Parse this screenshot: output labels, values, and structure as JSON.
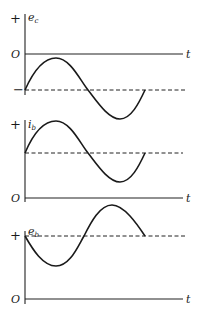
{
  "figure": {
    "colors": {
      "ink": "#1a1a1a",
      "background": "#ffffff"
    },
    "panels": [
      {
        "id": "ec",
        "y_label": "e",
        "y_label_sub": "c",
        "plus_label": "+",
        "origin_label": "O",
        "minus_label": "−",
        "t_label": "t",
        "dashed_reference": "negative DC bias level",
        "waveform": "sine riding on negative bias, starts rising"
      },
      {
        "id": "ib",
        "y_label": "i",
        "y_label_sub": "b",
        "plus_label": "+",
        "origin_label": "O",
        "t_label": "t",
        "dashed_reference": "positive DC quiescent level",
        "waveform": "sine riding on positive DC, in phase with e_c"
      },
      {
        "id": "eb",
        "y_label": "e",
        "y_label_sub": "b",
        "plus_label": "+",
        "origin_label": "O",
        "t_label": "t",
        "dashed_reference": "positive DC supply level",
        "waveform": "sine riding on positive DC, 180° out of phase with i_b"
      }
    ]
  }
}
